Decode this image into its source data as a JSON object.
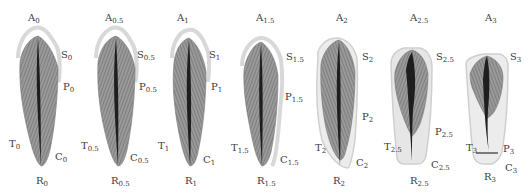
{
  "figure": {
    "type": "diagram",
    "stages": [
      {
        "id": "0",
        "A": "A",
        "S": "S",
        "P": "P",
        "T": "T",
        "C": "C",
        "R": "R",
        "sub": "0"
      },
      {
        "id": "0.5",
        "A": "A",
        "S": "S",
        "P": "P",
        "T": "T",
        "C": "C",
        "R": "R",
        "sub": "0.5"
      },
      {
        "id": "1",
        "A": "A",
        "S": "S",
        "P": "P",
        "T": "T",
        "C": "C",
        "R": "R",
        "sub": "1"
      },
      {
        "id": "1.5",
        "A": "A",
        "S": "S",
        "P": "P",
        "T": "T",
        "C": "C",
        "R": "R",
        "sub": "1.5"
      },
      {
        "id": "2",
        "A": "A",
        "S": "S",
        "P": "P",
        "T": "T",
        "C": "C",
        "R": "R",
        "sub": "2"
      },
      {
        "id": "2.5",
        "A": "A",
        "S": "S",
        "P": "P",
        "T": "T",
        "C": "C",
        "R": "R",
        "sub": "2.5"
      },
      {
        "id": "3",
        "A": "A",
        "S": "S",
        "P": "P",
        "T": "T",
        "C": "C",
        "R": "R",
        "sub": "3"
      }
    ]
  },
  "colors": {
    "shape_fill": "#8a8a8a",
    "shape_dark": "#1e1e1e",
    "outline": "#cfcfcf",
    "text": "#3a3a3a"
  }
}
